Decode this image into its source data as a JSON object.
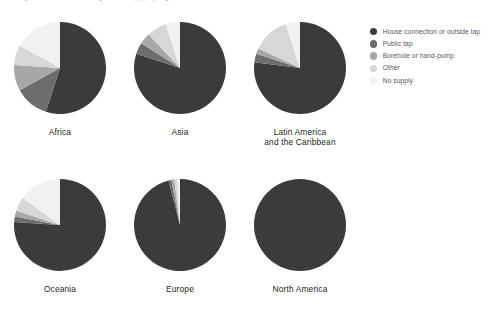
{
  "top_strip": {
    "text": "Figure: Access to drinking water supply by region, 2000"
  },
  "legend": {
    "items": [
      {
        "label": "House connection or outside tap",
        "color": "#3b3a3c"
      },
      {
        "label": "Public tap",
        "color": "#6d6c6e"
      },
      {
        "label": "Borehole or hand-pump",
        "color": "#a7a6a8"
      },
      {
        "label": "Other",
        "color": "#d8d7d8"
      },
      {
        "label": "No supply",
        "color": "#f2f1f1"
      }
    ]
  },
  "chart_data": {
    "type": "pie",
    "title": "Access to drinking water supply by region",
    "legend_position": "right",
    "categories": [
      "House connection or outside tap",
      "Public tap",
      "Borehole or hand-pump",
      "Other",
      "No supply"
    ],
    "colors": [
      "#3b3a3c",
      "#6d6c6e",
      "#a7a6a8",
      "#d8d7d8",
      "#f2f1f1"
    ],
    "charts": [
      {
        "name": "Africa",
        "label_lines": [
          "Africa"
        ],
        "values": [
          55,
          12,
          9,
          7,
          17
        ]
      },
      {
        "name": "Asia",
        "label_lines": [
          "Asia"
        ],
        "values": [
          80,
          4,
          4,
          7,
          5
        ]
      },
      {
        "name": "Latin America and the Caribbean",
        "label_lines": [
          "Latin America",
          "and the Caribbean"
        ],
        "values": [
          77,
          3,
          2,
          13,
          5
        ]
      },
      {
        "name": "Oceania",
        "label_lines": [
          "Oceania"
        ],
        "values": [
          76,
          2,
          2,
          5,
          15
        ]
      },
      {
        "name": "Europe",
        "label_lines": [
          "Europe"
        ],
        "values": [
          96,
          1,
          1,
          1,
          1
        ]
      },
      {
        "name": "North America",
        "label_lines": [
          "North America"
        ],
        "values": [
          100,
          0,
          0,
          0,
          0
        ]
      }
    ]
  }
}
